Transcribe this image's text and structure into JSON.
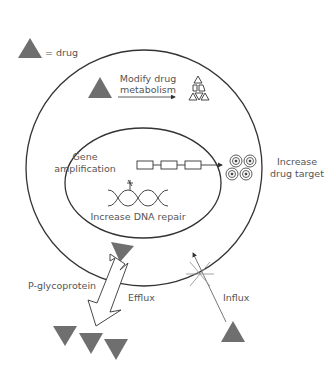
{
  "diagram": {
    "legend": {
      "symbol": "triangle",
      "label": "= drug",
      "color": "#6f6f6f"
    },
    "outer_membrane": {
      "label": "cell"
    },
    "nucleus": {
      "label": "nucleus"
    },
    "labels": {
      "modify_line1": "Modify drug",
      "modify_line2": "metabolism",
      "gene_line1": "Gene",
      "gene_line2": "amplification",
      "dna_repair": "Increase DNA repair",
      "target_line1": "Increase",
      "target_line2": "drug target",
      "pgp": "P-glycoprotein",
      "efflux": "Efflux",
      "influx": "Influx"
    },
    "colors": {
      "drug": "#6f6f6f",
      "line": "#333333",
      "text": "#555555",
      "blocked": "#999999"
    }
  }
}
